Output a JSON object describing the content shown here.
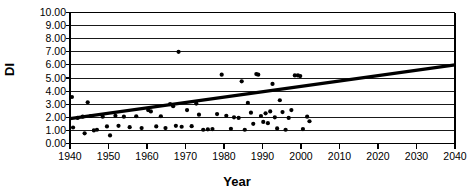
{
  "chart_data": {
    "type": "scatter",
    "title": "",
    "xlabel": "Year",
    "ylabel": "DI",
    "xlim": [
      1940,
      2040
    ],
    "ylim": [
      0.0,
      10.0
    ],
    "xticks": [
      1940,
      1950,
      1960,
      1970,
      1980,
      1990,
      2000,
      2010,
      2020,
      2030,
      2040
    ],
    "yticks": [
      "0.00",
      "1.00",
      "2.00",
      "3.00",
      "4.00",
      "5.00",
      "6.00",
      "7.00",
      "8.00",
      "9.00",
      "10.00"
    ],
    "grid": "horizontal",
    "legend": "none",
    "series": [
      {
        "name": "DI observations",
        "type": "scatter",
        "marker": "filled-circle",
        "color": "#000000",
        "points": [
          [
            1940.5,
            3.55
          ],
          [
            1940.8,
            1.22
          ],
          [
            1942.0,
            1.95
          ],
          [
            1943.3,
            2.05
          ],
          [
            1943.8,
            0.78
          ],
          [
            1944.6,
            3.15
          ],
          [
            1945.4,
            2.1
          ],
          [
            1946.2,
            1.0
          ],
          [
            1947.0,
            1.05
          ],
          [
            1948.5,
            2.05
          ],
          [
            1949.6,
            1.3
          ],
          [
            1950.4,
            0.62
          ],
          [
            1951.8,
            2.12
          ],
          [
            1952.6,
            1.35
          ],
          [
            1954.0,
            2.05
          ],
          [
            1955.5,
            1.25
          ],
          [
            1957.2,
            2.08
          ],
          [
            1958.6,
            1.18
          ],
          [
            1960.3,
            2.55
          ],
          [
            1961.0,
            2.45
          ],
          [
            1962.4,
            1.3
          ],
          [
            1963.6,
            2.08
          ],
          [
            1964.8,
            1.18
          ],
          [
            1966.0,
            3.0
          ],
          [
            1966.8,
            2.85
          ],
          [
            1967.5,
            1.35
          ],
          [
            1968.2,
            7.0
          ],
          [
            1969.0,
            1.28
          ],
          [
            1970.4,
            2.55
          ],
          [
            1971.6,
            1.32
          ],
          [
            1972.8,
            3.05
          ],
          [
            1973.5,
            2.2
          ],
          [
            1974.6,
            1.05
          ],
          [
            1975.8,
            1.08
          ],
          [
            1977.0,
            1.1
          ],
          [
            1978.2,
            2.25
          ],
          [
            1979.4,
            5.25
          ],
          [
            1980.6,
            2.12
          ],
          [
            1981.8,
            1.12
          ],
          [
            1982.6,
            2.0
          ],
          [
            1983.8,
            1.95
          ],
          [
            1984.6,
            4.75
          ],
          [
            1985.4,
            1.05
          ],
          [
            1986.2,
            3.1
          ],
          [
            1987.0,
            2.35
          ],
          [
            1987.6,
            1.5
          ],
          [
            1988.4,
            5.3
          ],
          [
            1988.9,
            5.25
          ],
          [
            1989.6,
            2.1
          ],
          [
            1990.2,
            1.65
          ],
          [
            1990.8,
            2.3
          ],
          [
            1991.4,
            1.55
          ],
          [
            1992.0,
            2.45
          ],
          [
            1992.6,
            4.55
          ],
          [
            1993.2,
            2.0
          ],
          [
            1993.8,
            1.15
          ],
          [
            1994.5,
            3.3
          ],
          [
            1995.2,
            2.4
          ],
          [
            1996.0,
            1.05
          ],
          [
            1996.8,
            1.95
          ],
          [
            1997.5,
            2.55
          ],
          [
            1998.4,
            5.2
          ],
          [
            1999.2,
            5.2
          ],
          [
            1999.8,
            5.15
          ],
          [
            2000.5,
            1.1
          ],
          [
            2001.6,
            2.05
          ],
          [
            2002.2,
            1.7
          ]
        ]
      },
      {
        "name": "Linear trend",
        "type": "line",
        "color": "#000000",
        "endpoints": [
          [
            1940,
            1.9
          ],
          [
            2040,
            6.0
          ]
        ]
      }
    ]
  }
}
